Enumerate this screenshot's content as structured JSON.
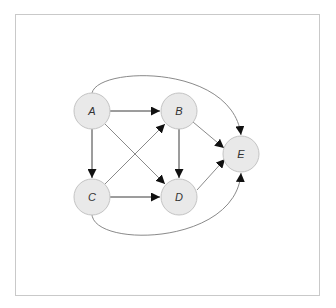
{
  "diagram": {
    "type": "directed-graph",
    "frame": {
      "border_color": "#c9c9c9",
      "background": "#ffffff"
    },
    "style": {
      "node_fill": "#e9e9e9",
      "node_stroke": "#c4c4c4",
      "label_color": "#333333",
      "arrow_color": "#111111"
    },
    "nodes": [
      {
        "id": "A",
        "label": "A",
        "cx": 92,
        "cy": 111,
        "r": 18
      },
      {
        "id": "B",
        "label": "B",
        "cx": 179,
        "cy": 111,
        "r": 18
      },
      {
        "id": "C",
        "label": "C",
        "cx": 92,
        "cy": 197,
        "r": 18
      },
      {
        "id": "D",
        "label": "D",
        "cx": 179,
        "cy": 197,
        "r": 18
      },
      {
        "id": "E",
        "label": "E",
        "cx": 241,
        "cy": 154,
        "r": 18
      }
    ],
    "edges": [
      {
        "from": "A",
        "to": "B",
        "shape": "straight"
      },
      {
        "from": "A",
        "to": "C",
        "shape": "straight"
      },
      {
        "from": "A",
        "to": "D",
        "shape": "straight"
      },
      {
        "from": "A",
        "to": "E",
        "shape": "curved-top"
      },
      {
        "from": "B",
        "to": "D",
        "shape": "straight"
      },
      {
        "from": "B",
        "to": "E",
        "shape": "straight"
      },
      {
        "from": "C",
        "to": "B",
        "shape": "straight"
      },
      {
        "from": "C",
        "to": "D",
        "shape": "straight"
      },
      {
        "from": "C",
        "to": "E",
        "shape": "curved-bottom"
      },
      {
        "from": "D",
        "to": "E",
        "shape": "straight"
      }
    ]
  }
}
